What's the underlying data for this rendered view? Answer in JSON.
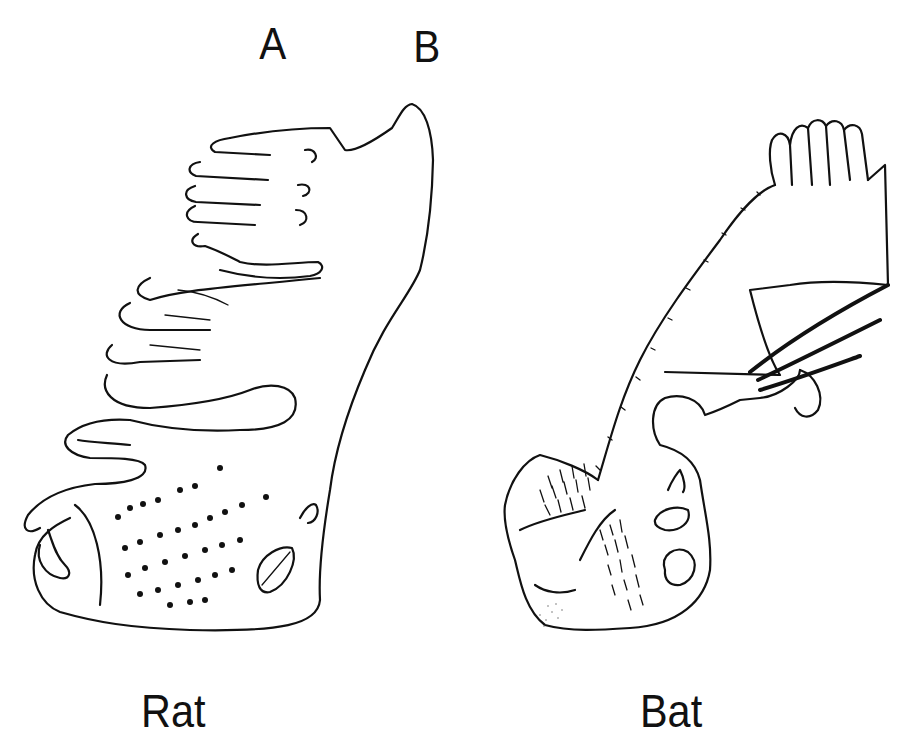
{
  "figure": {
    "panels": [
      {
        "id": "A",
        "letter": "A",
        "species": "Rat"
      },
      {
        "id": "B",
        "letter": "B",
        "species": "Bat"
      }
    ]
  },
  "colors": {
    "ink": "#111111",
    "background": "#ffffff"
  }
}
